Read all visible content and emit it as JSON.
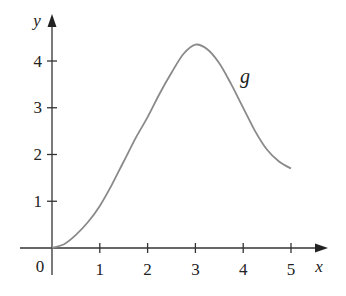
{
  "chart_data": {
    "type": "line",
    "title": "",
    "xlabel": "x",
    "ylabel": "y",
    "xlim": [
      0,
      5
    ],
    "ylim": [
      0,
      4.5
    ],
    "xticks": [
      "1",
      "2",
      "3",
      "4",
      "5"
    ],
    "yticks": [
      "1",
      "2",
      "3",
      "4"
    ],
    "origin_label": "0",
    "grid": false,
    "legend": null,
    "annotations": [
      {
        "text": "g",
        "x": 4.05,
        "y": 3.6
      }
    ],
    "series": [
      {
        "name": "g",
        "x": [
          0,
          0.25,
          0.5,
          0.75,
          1,
          1.25,
          1.5,
          1.75,
          2,
          2.25,
          2.5,
          2.75,
          3,
          3.25,
          3.5,
          3.75,
          4,
          4.25,
          4.5,
          4.75,
          5
        ],
        "values": [
          0,
          0.08,
          0.28,
          0.55,
          0.9,
          1.35,
          1.85,
          2.35,
          2.8,
          3.3,
          3.75,
          4.15,
          4.35,
          4.25,
          3.95,
          3.5,
          3.0,
          2.5,
          2.1,
          1.85,
          1.7
        ],
        "color": "#8a8a8a"
      }
    ]
  },
  "labels": {
    "x_axis": "x",
    "y_axis": "y",
    "origin": "0",
    "curve": "g",
    "x_ticks": [
      "1",
      "2",
      "3",
      "4",
      "5"
    ],
    "y_ticks": [
      "1",
      "2",
      "3",
      "4"
    ]
  }
}
